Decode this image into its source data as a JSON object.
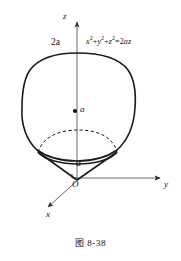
{
  "figure": {
    "caption": "图 8-38",
    "type": "3d-math-diagram"
  },
  "axes": {
    "z_label": "z",
    "y_label": "y",
    "x_label": "x",
    "origin_label": "O"
  },
  "annotations": {
    "top_value": "2a",
    "center_value": "a",
    "angle_label": "α",
    "equation_parts": {
      "x": "x",
      "x_exp": "2",
      "plus1": "+",
      "y": "y",
      "y_exp": "2",
      "plus2": "+",
      "z": "z",
      "z_exp": "2",
      "equals": "=2",
      "az": "az"
    },
    "equation_full": "x²+y²+z²=2az"
  },
  "colors": {
    "stroke": "#1a1a1a",
    "axis": "#555555",
    "background": "#ffffff"
  },
  "geometry": {
    "origin": [
      77,
      180
    ],
    "z_axis_top": [
      77,
      18
    ],
    "y_axis_end": [
      165,
      177
    ],
    "x_axis_end": [
      44,
      210
    ],
    "sphere_top": [
      77,
      53
    ],
    "sphere_center": [
      76,
      111
    ],
    "sphere_left": [
      22,
      108
    ],
    "sphere_right": [
      135,
      108
    ],
    "cone_left_rim": [
      38,
      152
    ],
    "cone_right_rim": [
      117,
      152
    ]
  }
}
